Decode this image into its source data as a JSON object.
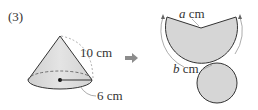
{
  "problem": {
    "number": "(3)"
  },
  "cone": {
    "slant_label": "10 cm",
    "radius_label": "6 cm"
  },
  "arrow": {
    "symbol": "➡",
    "color": "#8c8c8c"
  },
  "net": {
    "sector_var": "a",
    "sector_unit": " cm",
    "arc_var": "b",
    "arc_unit": " cm"
  },
  "colors": {
    "fill": "#d6d6d6",
    "stroke": "#333333",
    "dashed": "#999999"
  }
}
